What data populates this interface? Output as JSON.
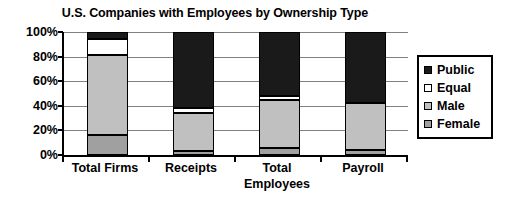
{
  "chart_data": {
    "type": "bar",
    "subtype": "stacked-100-percent-column",
    "title": "U.S. Companies with Employees by Ownership Type",
    "xlabel": "",
    "ylabel": "",
    "categories": [
      "Total Firms",
      "Receipts",
      "Total Employees",
      "Payroll"
    ],
    "category_lines": [
      [
        "Total Firms"
      ],
      [
        "Receipts"
      ],
      [
        "Total",
        "Employees"
      ],
      [
        "Payroll"
      ]
    ],
    "ylim": [
      0,
      100
    ],
    "ytick_labels": [
      "0%",
      "20%",
      "40%",
      "60%",
      "80%",
      "100%"
    ],
    "ytick_values": [
      0,
      20,
      40,
      60,
      80,
      100
    ],
    "grid": true,
    "legend_position": "right",
    "stack_order_bottom_to_top": [
      "Female",
      "Male",
      "Equal",
      "Public"
    ],
    "series": [
      {
        "name": "Female",
        "color": "#a0a0a0",
        "values": [
          16,
          3,
          6,
          4
        ]
      },
      {
        "name": "Male",
        "color": "#c0c0c0",
        "values": [
          65,
          31,
          39,
          38
        ]
      },
      {
        "name": "Equal",
        "color": "#ffffff",
        "values": [
          13,
          4,
          3,
          0
        ]
      },
      {
        "name": "Public",
        "color": "#1a1a1a",
        "values": [
          6,
          62,
          52,
          58
        ]
      }
    ],
    "legend_entries": [
      {
        "label": "Public",
        "color": "#1a1a1a"
      },
      {
        "label": "Equal",
        "color": "#ffffff"
      },
      {
        "label": "Male",
        "color": "#c0c0c0"
      },
      {
        "label": "Female",
        "color": "#a0a0a0"
      }
    ]
  }
}
